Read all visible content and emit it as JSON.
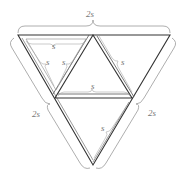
{
  "diagram": {
    "colors": {
      "edge": "#333333",
      "brace": "#999999",
      "label": "#777777"
    },
    "labels": {
      "top_side": "2s",
      "left_side": "2s",
      "right_side": "2s",
      "top_left_inner_top": "s",
      "top_left_inner_left": "s",
      "top_left_inner_right": "s",
      "upper_right_edge": "s",
      "middle_edge": "s",
      "lower_right_edge": "s"
    }
  }
}
